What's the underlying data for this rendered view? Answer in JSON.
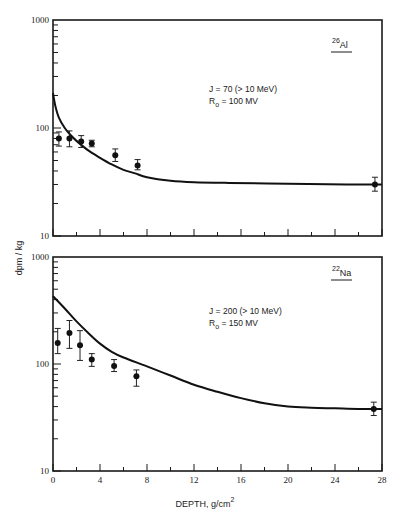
{
  "chart_data": [
    {
      "type": "scatter",
      "panel": "top",
      "title": "26Al",
      "isotope": {
        "mass": "26",
        "symbol": "Al"
      },
      "annotation": {
        "line1": "J  =  70 (> 10 MeV)",
        "line2_prefix": "R",
        "line2_sub": "o",
        "line2_suffix": " =  100 MV"
      },
      "xlabel": "",
      "ylabel": "dpm / kg",
      "xlim": [
        0,
        28
      ],
      "ylim": [
        10,
        1000
      ],
      "yscale": "log",
      "y_tick_labels": [
        "1000",
        "100",
        "10"
      ],
      "grid": false,
      "points": [
        {
          "x": 0.5,
          "y": 80,
          "err_low": 68,
          "err_high": 92
        },
        {
          "x": 1.4,
          "y": 80,
          "err_low": 67,
          "err_high": 94
        },
        {
          "x": 2.4,
          "y": 75,
          "err_low": 66,
          "err_high": 85
        },
        {
          "x": 3.3,
          "y": 72,
          "err_low": 67,
          "err_high": 77
        },
        {
          "x": 5.3,
          "y": 56,
          "err_low": 49,
          "err_high": 64
        },
        {
          "x": 7.2,
          "y": 45,
          "err_low": 41,
          "err_high": 51
        },
        {
          "x": 27.4,
          "y": 30,
          "err_low": 26,
          "err_high": 35
        }
      ],
      "model_curve": {
        "x": [
          0,
          0.2,
          0.5,
          1,
          1.5,
          2,
          3,
          4,
          5,
          6,
          7,
          8,
          10,
          12,
          15,
          20,
          25,
          28
        ],
        "y": [
          210,
          160,
          125,
          100,
          86,
          76,
          62,
          53,
          46,
          41,
          38,
          35,
          32.5,
          31.5,
          31,
          30.5,
          30,
          30
        ]
      }
    },
    {
      "type": "scatter",
      "panel": "bottom",
      "title": "22Na",
      "isotope": {
        "mass": "22",
        "symbol": "Na"
      },
      "annotation": {
        "line1": "J  =  200 (> 10 MeV)",
        "line2_prefix": "R",
        "line2_sub": "o",
        "line2_suffix": " =  150 MV"
      },
      "xlabel": "DEPTH, g/cm",
      "xlabel_sup": "2",
      "ylabel": "dpm / kg",
      "xlim": [
        0,
        28
      ],
      "ylim": [
        10,
        1000
      ],
      "yscale": "log",
      "x_ticks": [
        0,
        4,
        8,
        12,
        16,
        20,
        24,
        28
      ],
      "x_tick_labels": [
        "0",
        "4",
        "8",
        "12",
        "16",
        "20",
        "24",
        "28"
      ],
      "y_tick_labels": [
        "1000",
        "100",
        "10"
      ],
      "grid": false,
      "points": [
        {
          "x": 0.4,
          "y": 157,
          "err_low": 125,
          "err_high": 215
        },
        {
          "x": 1.4,
          "y": 195,
          "err_low": 140,
          "err_high": 255
        },
        {
          "x": 2.3,
          "y": 150,
          "err_low": 108,
          "err_high": 205
        },
        {
          "x": 3.3,
          "y": 110,
          "err_low": 95,
          "err_high": 125
        },
        {
          "x": 5.2,
          "y": 96,
          "err_low": 85,
          "err_high": 110
        },
        {
          "x": 7.1,
          "y": 77,
          "err_low": 62,
          "err_high": 88
        },
        {
          "x": 27.3,
          "y": 38,
          "err_low": 33,
          "err_high": 44
        }
      ],
      "model_curve": {
        "x": [
          0,
          1,
          2,
          3,
          4,
          5,
          6,
          8,
          10,
          12,
          14,
          16,
          18,
          20,
          22,
          24,
          26,
          28
        ],
        "y": [
          430,
          330,
          250,
          195,
          155,
          130,
          115,
          95,
          78,
          64,
          55,
          48,
          43,
          40,
          39,
          38.5,
          38,
          38
        ]
      }
    }
  ],
  "axes": {
    "ylabel": "dpm / kg",
    "xlabel": "DEPTH, g/cm",
    "xlabel_sup": "2"
  }
}
